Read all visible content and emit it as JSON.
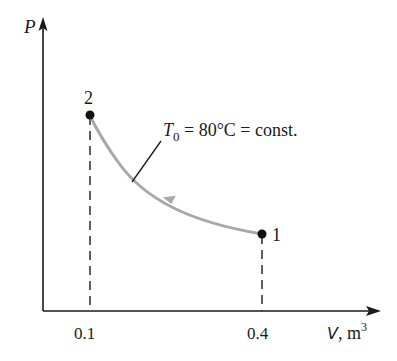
{
  "diagram": {
    "type": "pv-diagram",
    "axes": {
      "y_label": "P",
      "x_label": "V",
      "x_unit_prefix": ", m",
      "x_unit_exp": "3",
      "x_ticks": [
        "0.1",
        "0.4"
      ]
    },
    "points": [
      {
        "id": "1",
        "label": "1",
        "V": 0.4
      },
      {
        "id": "2",
        "label": "2",
        "V": 0.1
      }
    ],
    "process": {
      "from": "1",
      "to": "2",
      "annotation_sym": "T",
      "annotation_sub": "0",
      "annotation_rest": " = 80°C = const."
    },
    "colors": {
      "axis": "#1a1a1a",
      "curve": "#a8a8a8",
      "point": "#111111"
    }
  }
}
